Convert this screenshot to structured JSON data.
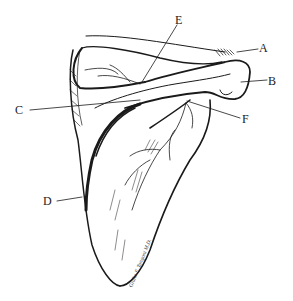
{
  "figure": {
    "stroke_color": "#1a1a1a",
    "background": "#ffffff",
    "signature": "Giulio F. Tangoni M.D."
  },
  "labels": [
    {
      "id": "A",
      "text": "A",
      "x": 259,
      "y": 42
    },
    {
      "id": "B",
      "text": "B",
      "x": 268,
      "y": 75
    },
    {
      "id": "C",
      "text": "C",
      "x": 15,
      "y": 104
    },
    {
      "id": "D",
      "text": "D",
      "x": 43,
      "y": 195
    },
    {
      "id": "E",
      "text": "E",
      "x": 175,
      "y": 14
    },
    {
      "id": "F",
      "text": "F",
      "x": 242,
      "y": 113
    }
  ]
}
